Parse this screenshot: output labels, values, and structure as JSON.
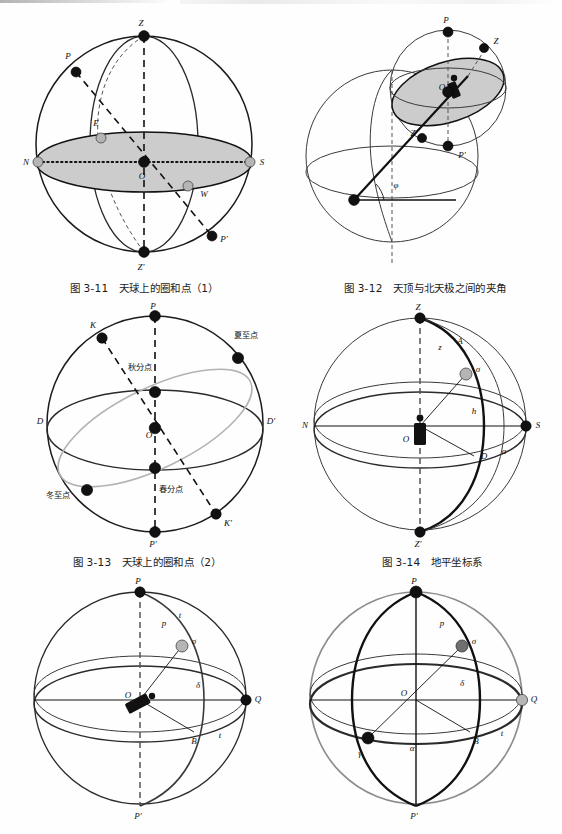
{
  "page": {
    "background": "#fefefe",
    "ink": "#111111",
    "accent_gray": "#b5b5b5",
    "shade_fill": "#cccccc"
  },
  "figures": [
    {
      "id": "fig-3-11",
      "caption": "图 3-11　天球上的圈和点（1）",
      "number": "图 3-11",
      "title": "天球上的圈和点（1）",
      "points": [
        {
          "key": "Z",
          "label": "Z",
          "style": "dark"
        },
        {
          "key": "Z2",
          "label": "Z'",
          "style": "dark"
        },
        {
          "key": "P",
          "label": "P",
          "style": "dark"
        },
        {
          "key": "P2",
          "label": "P'",
          "style": "dark"
        },
        {
          "key": "N",
          "label": "N",
          "style": "gray"
        },
        {
          "key": "S",
          "label": "S",
          "style": "gray"
        },
        {
          "key": "E",
          "label": "E",
          "style": "gray"
        },
        {
          "key": "W",
          "label": "W",
          "style": "gray"
        },
        {
          "key": "O",
          "label": "O",
          "style": "dark"
        }
      ]
    },
    {
      "id": "fig-3-12",
      "caption": "图 3-12　天顶与北天极之间的夹角",
      "number": "图 3-12",
      "title": "天顶与北天极之间的夹角",
      "points": [
        {
          "key": "P",
          "label": "P",
          "style": "dark"
        },
        {
          "key": "Z",
          "label": "Z",
          "style": "dark"
        },
        {
          "key": "Zp",
          "label": "Z'",
          "style": "dark"
        },
        {
          "key": "Pp",
          "label": "P'",
          "style": "dark"
        },
        {
          "key": "O",
          "label": "O",
          "style": "dark"
        }
      ],
      "angle": "φ"
    },
    {
      "id": "fig-3-13",
      "caption": "图 3-13　天球上的圈和点（2）",
      "number": "图 3-13",
      "title": "天球上的圈和点（2）",
      "points": [
        {
          "key": "P",
          "label": "P",
          "style": "dark"
        },
        {
          "key": "P2",
          "label": "P'",
          "style": "dark"
        },
        {
          "key": "K",
          "label": "K",
          "style": "dark"
        },
        {
          "key": "K2",
          "label": "K'",
          "style": "dark"
        },
        {
          "key": "D",
          "label": "D",
          "style": "none"
        },
        {
          "key": "D2",
          "label": "D'",
          "style": "none"
        },
        {
          "key": "O",
          "label": "O",
          "style": "dark"
        }
      ],
      "cn_labels": [
        {
          "key": "autumn",
          "label": "秋分点"
        },
        {
          "key": "summer",
          "label": "夏至点"
        },
        {
          "key": "spring",
          "label": "春分点"
        },
        {
          "key": "winter",
          "label": "冬至点"
        }
      ]
    },
    {
      "id": "fig-3-14",
      "caption": "图 3-14　地平坐标系",
      "number": "图 3-14",
      "title": "地平坐标系",
      "points": [
        {
          "key": "Z",
          "label": "Z",
          "style": "dark"
        },
        {
          "key": "Z2",
          "label": "Z'",
          "style": "dark"
        },
        {
          "key": "N",
          "label": "N",
          "style": "none"
        },
        {
          "key": "S",
          "label": "S",
          "style": "dark"
        },
        {
          "key": "O",
          "label": "O",
          "style": "none"
        },
        {
          "key": "star",
          "label": "σ",
          "style": "gray"
        },
        {
          "key": "A",
          "label": "A",
          "style": "none"
        },
        {
          "key": "z",
          "label": "z",
          "style": "none"
        },
        {
          "key": "h",
          "label": "h",
          "style": "none"
        },
        {
          "key": "D",
          "label": "D",
          "style": "none"
        },
        {
          "key": "a",
          "label": "a",
          "style": "none"
        }
      ]
    },
    {
      "id": "fig-bl",
      "caption": "",
      "points": [
        {
          "key": "P",
          "label": "P",
          "style": "dark"
        },
        {
          "key": "P2",
          "label": "P'",
          "style": "none"
        },
        {
          "key": "O",
          "label": "O",
          "style": "none"
        },
        {
          "key": "Q",
          "label": "Q",
          "style": "dark"
        },
        {
          "key": "star",
          "label": "σ",
          "style": "gray"
        },
        {
          "key": "B",
          "label": "B",
          "style": "none"
        },
        {
          "key": "t1",
          "label": "t",
          "style": "none"
        },
        {
          "key": "t2",
          "label": "t",
          "style": "none"
        },
        {
          "key": "p",
          "label": "p",
          "style": "none"
        },
        {
          "key": "delta",
          "label": "δ",
          "style": "none"
        }
      ]
    },
    {
      "id": "fig-br",
      "caption": "",
      "points": [
        {
          "key": "P",
          "label": "P",
          "style": "dark"
        },
        {
          "key": "P2",
          "label": "P'",
          "style": "none"
        },
        {
          "key": "O",
          "label": "O",
          "style": "none"
        },
        {
          "key": "Q",
          "label": "Q",
          "style": "gray"
        },
        {
          "key": "star",
          "label": "σ",
          "style": "mid"
        },
        {
          "key": "B",
          "label": "B",
          "style": "none"
        },
        {
          "key": "gamma",
          "label": "γ",
          "style": "dark"
        },
        {
          "key": "alpha",
          "label": "α",
          "style": "none"
        },
        {
          "key": "delta",
          "label": "δ",
          "style": "none"
        },
        {
          "key": "t",
          "label": "t",
          "style": "none"
        },
        {
          "key": "p",
          "label": "p",
          "style": "none"
        }
      ]
    }
  ]
}
